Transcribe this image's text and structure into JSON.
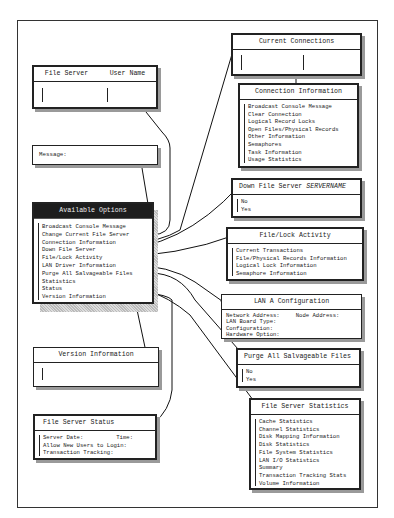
{
  "login_box": {
    "col1": "File Server",
    "col2": "User Name"
  },
  "message_box": {
    "label": "Message:"
  },
  "available_options": {
    "title": "Available Options",
    "items": [
      "Broadcast Console Message",
      "Change Current File Server",
      "Connection Information",
      "Down File Server",
      "File/Lock Activity",
      "LAN Driver Information",
      "Purge All Salvageable Files",
      "Statistics",
      "Status",
      "Version Information"
    ]
  },
  "version_box": {
    "title": "Version Information"
  },
  "status_box": {
    "title": "File Server Status",
    "lines": [
      "Server Date:",
      "Time:",
      "Allow New Users to Login:",
      "Transaction Tracking:"
    ]
  },
  "current_connections": {
    "title": "Current Connections"
  },
  "connection_info": {
    "title": "Connection Information",
    "items": [
      "Broadcast Console Message",
      "Clear Connection",
      "Logical Record Locks",
      "Open Files/Physical Records",
      "Other Information",
      "Semaphores",
      "Task Information",
      "Usage Statistics"
    ]
  },
  "down_server": {
    "title": "Down File Server",
    "title_var": "SERVERNAME",
    "items": [
      "No",
      "Yes"
    ]
  },
  "file_lock": {
    "title": "File/Lock Activity",
    "items": [
      "Current Transactions",
      "File/Physical Records Information",
      "Logical Lock Information",
      "Semaphore Information"
    ]
  },
  "lan_config": {
    "title": "LAN A Configuration",
    "network_address": "Network Address:",
    "node_address": "Node Address:",
    "lines": [
      "LAN Board Type:",
      "Configuration:",
      "Hardware Option:"
    ]
  },
  "purge": {
    "title": "Purge All Salvageable Files",
    "items": [
      "No",
      "Yes"
    ]
  },
  "server_stats": {
    "title": "File Server Statistics",
    "items": [
      "Cache Statistics",
      "Channel Statistics",
      "Disk Mapping Information",
      "Disk Statistics",
      "File System Statistics",
      "LAN I/O Statistics",
      "Summary",
      "Transaction Tracking Stats",
      "Volume Information"
    ]
  }
}
